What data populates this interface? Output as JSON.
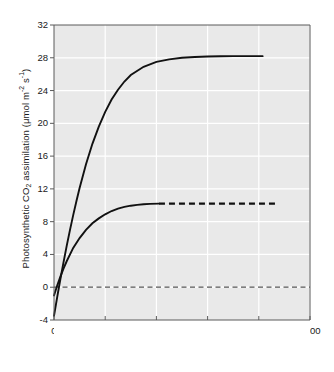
{
  "chart_data": {
    "type": "line",
    "title": "",
    "xlabel": "PPFD (μmol m⁻² s⁻¹)",
    "ylabel": "Photosynthetic CO₂ assimilation (μmol m⁻² s⁻¹)",
    "xlim": [
      0,
      2000
    ],
    "ylim": [
      -4,
      32
    ],
    "xticks": [
      0,
      400,
      800,
      1200,
      1600,
      2000
    ],
    "yticks": [
      -4,
      0,
      4,
      8,
      12,
      16,
      20,
      24,
      28,
      32
    ],
    "grid": true,
    "grid_color": "#ffffff",
    "plot_background": "#e9e9e9",
    "legend": "inline-annotations",
    "annotations": [
      {
        "name": "sun-plant-label",
        "species": "Atriplex triangularis",
        "descriptor": "(sun plant)",
        "x_data": 640,
        "y_data": 25.0
      },
      {
        "name": "shade-plant-label",
        "species": "Asarum caudatum",
        "descriptor": "(shade plant)",
        "x_data": 900,
        "y_data": 8.6
      }
    ],
    "reference_lines": [
      {
        "name": "zero-line",
        "orientation": "horizontal",
        "y": 0,
        "style": "dashed",
        "color": "#555555"
      }
    ],
    "series": [
      {
        "name": "Atriplex triangularis (sun plant)",
        "short_name": "sun-plant",
        "color": "#111111",
        "style": "solid",
        "asymptote": 28.2,
        "y_intercept": -3.5,
        "light_compensation_point": 38,
        "x": [
          0,
          25,
          50,
          75,
          100,
          125,
          150,
          175,
          200,
          250,
          300,
          350,
          400,
          450,
          500,
          550,
          600,
          700,
          800,
          900,
          1000,
          1100,
          1200,
          1300,
          1400,
          1500,
          1630
        ],
        "y": [
          -3.5,
          -1.2,
          1.0,
          3.1,
          5.1,
          7.0,
          8.8,
          10.5,
          12.1,
          15.0,
          17.5,
          19.6,
          21.4,
          22.9,
          24.1,
          25.1,
          25.9,
          26.9,
          27.5,
          27.8,
          28.0,
          28.1,
          28.15,
          28.18,
          28.2,
          28.2,
          28.2
        ]
      },
      {
        "name": "Asarum caudatum (shade plant)",
        "short_name": "shade-plant",
        "color": "#111111",
        "style": "solid-then-dashed",
        "asymptote": 10.2,
        "y_intercept": -1.0,
        "light_compensation_point": 28,
        "solid_until_x": 820,
        "dashed_until_x": 1740,
        "x": [
          0,
          25,
          50,
          75,
          100,
          150,
          200,
          250,
          300,
          350,
          400,
          450,
          500,
          550,
          600,
          650,
          700,
          750,
          820,
          1000,
          1200,
          1400,
          1600,
          1740
        ],
        "y": [
          -1.0,
          0.2,
          1.3,
          2.3,
          3.2,
          4.8,
          6.0,
          7.0,
          7.8,
          8.4,
          8.9,
          9.3,
          9.6,
          9.8,
          9.95,
          10.05,
          10.12,
          10.17,
          10.2,
          10.2,
          10.2,
          10.2,
          10.2,
          10.2
        ]
      }
    ]
  },
  "axes": {
    "x_tick_labels": [
      "0",
      "400",
      "800",
      "1200",
      "1600",
      "2000"
    ],
    "y_tick_labels": [
      "32",
      "28",
      "24",
      "20",
      "16",
      "12",
      "8",
      "4",
      "0",
      "-4"
    ],
    "x_title_parts": {
      "prefix": "PPFD (μmol m",
      "sup1": "-2",
      "mid": " s",
      "sup2": "-1",
      "suffix": ")"
    },
    "y_title_parts": {
      "prefix": "Photosynthetic CO",
      "sub1": "2",
      "mid": " assimilation (μmol m",
      "sup1": "-2",
      "mid2": " s",
      "sup2": "-1",
      "suffix": ")"
    }
  }
}
